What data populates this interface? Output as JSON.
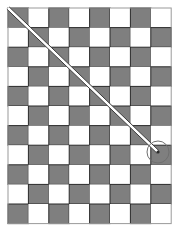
{
  "figure": {
    "width": 180,
    "height": 226,
    "background_color": "#ffffff"
  },
  "grid": {
    "name": "checkerboard",
    "origin_x": 8,
    "origin_y": 8,
    "cell_width": 20.4,
    "cell_height": 19.6,
    "columns": 8,
    "rows": 11,
    "dark_color": "#7f7f7f",
    "light_color": "#ffffff",
    "border_color": "#2b2b2b",
    "border_width": 1,
    "parity_offset": 0,
    "outer_border_color": "#9a9a9a",
    "outer_border_width": 1
  },
  "diagonal": {
    "name": "double-diagonal-line",
    "stroke_color": "#3a3a3a",
    "stroke_width": 1,
    "fill_color": "#ffffff",
    "offset": 3.2,
    "start_x": 8,
    "start_y": 8,
    "end_x": 158,
    "end_y": 152
  },
  "circle": {
    "name": "endpoint-circle",
    "center_x": 158,
    "center_y": 152,
    "radius": 11,
    "stroke_color": "#6f6f6f",
    "stroke_width": 1,
    "fill": "none"
  },
  "endpoint_dot": {
    "name": "endpoint-dot",
    "center_x": 158,
    "center_y": 152,
    "radius": 1.6,
    "color": "#2b2b2b"
  }
}
